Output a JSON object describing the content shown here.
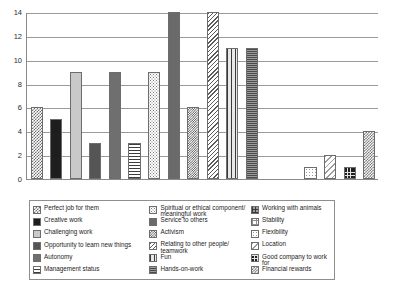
{
  "chart_data": {
    "type": "bar",
    "title": "",
    "xlabel": "",
    "ylabel": "",
    "ylim": [
      0,
      14
    ],
    "yticks": [
      0,
      2,
      4,
      6,
      8,
      10,
      12,
      14
    ],
    "grid": true,
    "legend_position": "bottom",
    "categories": [
      "Perfect job for them",
      "Creative work",
      "Challenging work",
      "Opportunity to learn new things",
      "Autonomy",
      "Management status",
      "Spiritual or ethical component/\nmeaningful work",
      "Service to others",
      "Activism",
      "Relating to other people/\nteamwork",
      "Fun",
      "Hands-on-work",
      "Working with animals",
      "Stability",
      "Flexibility",
      "Location",
      "Good company to work for",
      "Financial rewards"
    ],
    "values": [
      6,
      5,
      9,
      3,
      9,
      3,
      9,
      14,
      6,
      14,
      11,
      11,
      0,
      0,
      1,
      2,
      1,
      4
    ],
    "patterns": [
      "p-checker-dk",
      "p-solid-black",
      "p-solid-light",
      "p-solid-dkgray",
      "p-solid-midgray",
      "p-hlines-wide",
      "p-dots-light",
      "p-solid-gray",
      "p-checker-fine",
      "p-diag-hatch",
      "p-vlines-thick",
      "p-hlines-fine",
      "p-grid-vh",
      "p-grid-open",
      "p-dots-sparse",
      "p-diag-light",
      "p-grid-dark",
      "p-checker-md"
    ]
  },
  "legend": {
    "columns": [
      {
        "items": [
          {
            "label": "Perfect job for them",
            "pattern": "p-checker-dk"
          },
          {
            "label": "Creative work",
            "pattern": "p-solid-black"
          },
          {
            "label": "Challenging work",
            "pattern": "p-solid-light"
          },
          {
            "label": "Opportunity to learn new things",
            "pattern": "p-solid-dkgray"
          },
          {
            "label": "Autonomy",
            "pattern": "p-solid-midgray"
          },
          {
            "label": "Management status",
            "pattern": "p-hlines-wide"
          }
        ]
      },
      {
        "items": [
          {
            "label": "Spiritual or ethical component/\nmeaningful work",
            "pattern": "p-dots-light"
          },
          {
            "label": "Service to others",
            "pattern": "p-solid-gray"
          },
          {
            "label": "Activism",
            "pattern": "p-checker-fine"
          },
          {
            "label": "Relating to other people/\nteamwork",
            "pattern": "p-diag-hatch"
          },
          {
            "label": "Fun",
            "pattern": "p-vlines-thick"
          },
          {
            "label": "Hands-on-work",
            "pattern": "p-hlines-fine"
          }
        ]
      },
      {
        "items": [
          {
            "label": "Working with animals",
            "pattern": "p-grid-vh"
          },
          {
            "label": "Stability",
            "pattern": "p-grid-open"
          },
          {
            "label": "Flexibility",
            "pattern": "p-dots-sparse"
          },
          {
            "label": "Location",
            "pattern": "p-diag-light"
          },
          {
            "label": "Good company to work for",
            "pattern": "p-grid-dark"
          },
          {
            "label": "Financial rewards",
            "pattern": "p-checker-md"
          }
        ]
      }
    ]
  },
  "colors": {
    "axis": "#8a8a8a",
    "gridline": "#9a9a9a",
    "text": "#1b1b1b",
    "background": "#ffffff",
    "bar_outline": "#6d6d6d"
  }
}
